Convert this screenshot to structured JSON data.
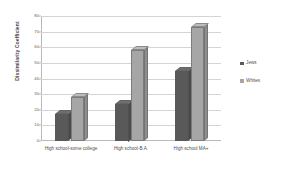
{
  "chart_data": {
    "type": "bar",
    "title": "",
    "subtitle": "",
    "xlabel": "",
    "ylabel": "Dissimilarity Coefficient",
    "ylim": [
      0,
      80
    ],
    "ytick_step": 10,
    "yticks": [
      "0",
      "10",
      "20",
      "30",
      "40",
      "50",
      "60",
      "70",
      "80"
    ],
    "grid": true,
    "legend_position": "right",
    "categories": [
      "High school-some college",
      "High school-B.A.",
      "High school MA+"
    ],
    "series": [
      {
        "name": "Jews",
        "color": "#595959",
        "values": [
          17,
          24,
          45
        ]
      },
      {
        "name": "Whites",
        "color": "#a6a6a6",
        "values": [
          28,
          58,
          73
        ]
      }
    ]
  }
}
